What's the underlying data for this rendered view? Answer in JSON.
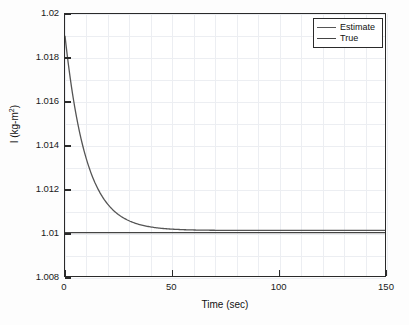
{
  "figure": {
    "background_color": "#fdfdfd",
    "plot_background_color": "#ffffff",
    "axis_color": "#2a2a2a",
    "grid_color": "#eceef2"
  },
  "axis_titles": {
    "x": "Time (sec)",
    "y_main": "I (kg-m",
    "y_sup": "2",
    "y_tail": ")"
  },
  "legend": {
    "position": "top-right-inside",
    "entries": [
      {
        "label": "Estimate",
        "color": "#555555"
      },
      {
        "label": "True",
        "color": "#444444"
      }
    ]
  },
  "ticks": {
    "y": [
      "1.02",
      "1.018",
      "1.016",
      "1.014",
      "1.012",
      "1.01",
      "1.008"
    ],
    "x": [
      "0",
      "50",
      "100",
      "150"
    ]
  },
  "chart_data": {
    "type": "line",
    "title": "",
    "xlabel": "Time (sec)",
    "ylabel": "I (kg-m^2)",
    "xlim": [
      0,
      150
    ],
    "ylim": [
      1.008,
      1.02
    ],
    "xticks": [
      0,
      50,
      100,
      150
    ],
    "yticks": [
      1.008,
      1.01,
      1.012,
      1.014,
      1.016,
      1.018,
      1.02
    ],
    "grid": true,
    "legend_position": "upper right",
    "series": [
      {
        "name": "Estimate",
        "color": "#555555",
        "description": "Exponential decay from 1.0190 at t=0 converging to 1.0101 with time constant approximately 10 s",
        "model": "y = 1.0101 + 0.0089 * exp(-t/10)",
        "x": [
          0,
          2,
          4,
          6,
          8,
          10,
          12,
          14,
          16,
          18,
          20,
          25,
          30,
          35,
          40,
          45,
          50,
          60,
          70,
          80,
          90,
          100,
          110,
          120,
          130,
          140,
          150
        ],
        "y": [
          1.019,
          1.01738,
          1.01607,
          1.01498,
          1.0141,
          1.01338,
          1.01278,
          1.01229,
          1.0119,
          1.01157,
          1.0113,
          1.01083,
          1.01054,
          1.01037,
          1.01026,
          1.0102,
          1.01016,
          1.01012,
          1.01011,
          1.0101,
          1.0101,
          1.0101,
          1.0101,
          1.0101,
          1.0101,
          1.0101,
          1.0101
        ]
      },
      {
        "name": "True",
        "color": "#444444",
        "description": "Constant reference value at 1.010 across the full time span",
        "model": "y = 1.0100",
        "x": [
          0,
          150
        ],
        "y": [
          1.01,
          1.01
        ]
      }
    ]
  }
}
